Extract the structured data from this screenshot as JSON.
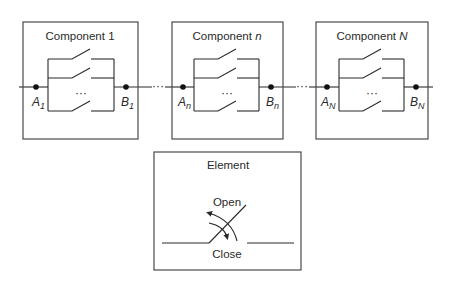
{
  "diagram": {
    "components": [
      {
        "id": "component-1",
        "title_prefix": "Component ",
        "title_index": "1",
        "index_italic": false,
        "terminal_a": {
          "letter": "A",
          "sub": "1"
        },
        "terminal_b": {
          "letter": "B",
          "sub": "1"
        },
        "ellipsis": "···"
      },
      {
        "id": "component-n",
        "title_prefix": "Component ",
        "title_index": "n",
        "index_italic": true,
        "terminal_a": {
          "letter": "A",
          "sub": "n"
        },
        "terminal_b": {
          "letter": "B",
          "sub": "n"
        },
        "ellipsis": "···"
      },
      {
        "id": "component-N",
        "title_prefix": "Component ",
        "title_index": "N",
        "index_italic": true,
        "terminal_a": {
          "letter": "A",
          "sub": "N"
        },
        "terminal_b": {
          "letter": "B",
          "sub": "N"
        },
        "ellipsis": "···"
      }
    ],
    "between_ellipsis": [
      "···",
      "···"
    ],
    "element_legend": {
      "title": "Element",
      "open_label": "Open",
      "close_label": "Close"
    },
    "colors": {
      "line": "#2a2a2a",
      "box": "#4a4a4a",
      "text": "#2a2a2a",
      "background": "#ffffff"
    }
  }
}
